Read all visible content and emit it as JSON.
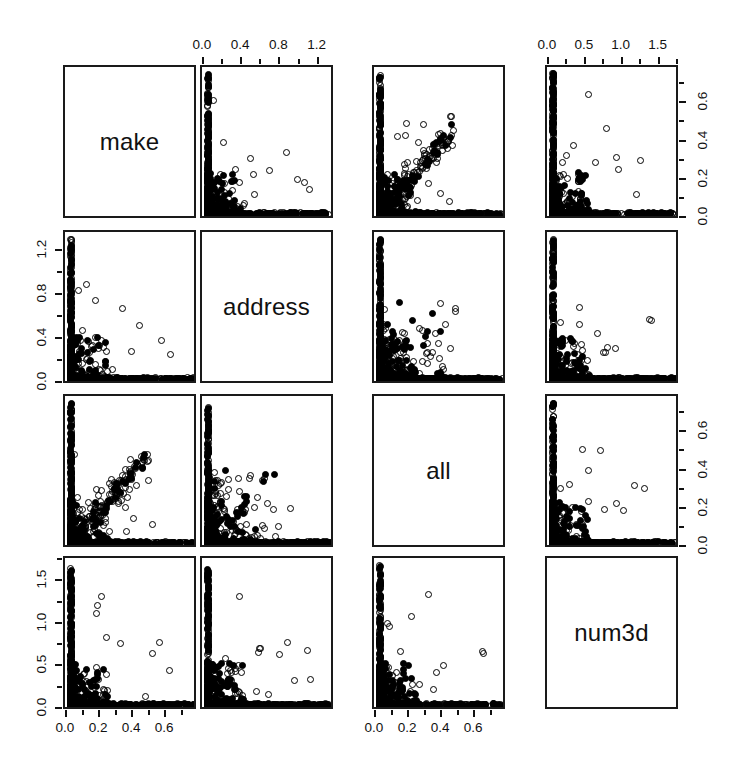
{
  "figure": {
    "type": "scatterplot-matrix",
    "title": "",
    "variables": [
      "make",
      "address",
      "all",
      "num3d"
    ],
    "background": "#ffffff",
    "point_color": "#000000",
    "panel_border_color": "#1a1a1a"
  },
  "chart_data": {
    "type": "scatter",
    "title": "",
    "xlabel": "",
    "ylabel": "",
    "grid": false,
    "legend": "none",
    "matrix": {
      "variables": [
        "make",
        "address",
        "all",
        "num3d"
      ],
      "diagonal_labels": [
        "make",
        "address",
        "all",
        "num3d"
      ],
      "axis_ranges": {
        "make": [
          0.0,
          0.78
        ],
        "address": [
          0.0,
          1.35
        ],
        "all": [
          0.0,
          0.78
        ],
        "num3d": [
          0.0,
          1.75
        ]
      },
      "ticks": {
        "make": [
          0.0,
          0.2,
          0.4,
          0.6
        ],
        "address": [
          0.0,
          0.4,
          0.8,
          1.2
        ],
        "all": [
          0.0,
          0.2,
          0.4,
          0.6
        ],
        "num3d": [
          0.0,
          0.5,
          1.0,
          1.5
        ]
      },
      "axis_placement": {
        "top": [
          "address",
          "num3d"
        ],
        "bottom": [
          "make",
          "all"
        ],
        "left": [
          "address",
          "num3d"
        ],
        "right": [
          "make",
          "all"
        ]
      }
    },
    "panels": [
      {
        "row": 1,
        "col": 2,
        "x_var": "address",
        "y_var": "make",
        "shape": "L-shaped, dense along both axes, one outlier near x=0.65"
      },
      {
        "row": 1,
        "col": 3,
        "x_var": "all",
        "y_var": "make",
        "shape": "positive diagonal band with dense axis margins"
      },
      {
        "row": 1,
        "col": 4,
        "x_var": "num3d",
        "y_var": "make",
        "shape": "L-shaped, sparse interior"
      },
      {
        "row": 2,
        "col": 1,
        "x_var": "make",
        "y_var": "address",
        "shape": "L-shaped, dense lower-left cloud"
      },
      {
        "row": 2,
        "col": 3,
        "x_var": "all",
        "y_var": "address",
        "shape": "L-shaped with scattered mid points"
      },
      {
        "row": 2,
        "col": 4,
        "x_var": "num3d",
        "y_var": "address",
        "shape": "L-shaped, sparse interior"
      },
      {
        "row": 3,
        "col": 1,
        "x_var": "make",
        "y_var": "all",
        "shape": "positive diagonal band"
      },
      {
        "row": 3,
        "col": 2,
        "x_var": "address",
        "y_var": "all",
        "shape": "dense lower-left cloud with scatter"
      },
      {
        "row": 3,
        "col": 4,
        "x_var": "num3d",
        "y_var": "all",
        "shape": "L-shaped, few mid outliers"
      },
      {
        "row": 4,
        "col": 1,
        "x_var": "make",
        "y_var": "num3d",
        "shape": "L-shaped, points along axes"
      },
      {
        "row": 4,
        "col": 2,
        "x_var": "address",
        "y_var": "num3d",
        "shape": "L-shaped, points along axes"
      },
      {
        "row": 4,
        "col": 3,
        "x_var": "all",
        "y_var": "num3d",
        "shape": "L-shaped, points along axes"
      }
    ]
  }
}
